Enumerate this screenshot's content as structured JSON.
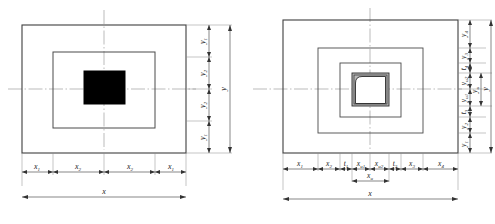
{
  "figure": {
    "panels": [
      {
        "id": "left",
        "name": "solid-core-section",
        "description": "Nested rectangles with solid black core",
        "rect_count": 2,
        "core": {
          "name": "solid-core",
          "fill": "#000000"
        },
        "horizontal_dimensions": {
          "segments": [
            "x1",
            "x2",
            "x2",
            "x1"
          ],
          "segment_labels": [
            "x",
            "x",
            "x",
            "x"
          ],
          "segment_subs": [
            "1",
            "2",
            "2",
            "1"
          ],
          "overall": "x",
          "overall_sub": ""
        },
        "vertical_dimensions": {
          "segments": [
            "y1",
            "y2",
            "y2",
            "y1"
          ],
          "segment_labels": [
            "y",
            "y",
            "y",
            "y"
          ],
          "segment_subs": [
            "1",
            "2",
            "2",
            "1"
          ],
          "overall": "y",
          "overall_sub": ""
        }
      },
      {
        "id": "right",
        "name": "hollow-tube-section",
        "description": "Three nested rectangles with hollow rounded tube core",
        "rect_count": 3,
        "core": {
          "name": "hollow-tube-core",
          "fill": "#b8b8b8"
        },
        "horizontal_dimensions": {
          "segment_labels": [
            "x",
            "x",
            "t",
            "x",
            "x",
            "t",
            "x",
            "x"
          ],
          "segment_subs": [
            "1",
            "2",
            "1",
            "u1",
            "u2",
            "2",
            "3",
            "4"
          ],
          "inner_group": "x",
          "inner_group_sub": "u",
          "overall": "x",
          "overall_sub": ""
        },
        "vertical_dimensions": {
          "segment_labels": [
            "y",
            "y",
            "t",
            "y",
            "y",
            "t",
            "y",
            "y"
          ],
          "segment_subs": [
            "4",
            "3",
            "4",
            "u2",
            "u1",
            "3",
            "2",
            "1"
          ],
          "inner_group": "y",
          "inner_group_sub": "u",
          "overall": "y",
          "overall_sub": ""
        }
      }
    ],
    "colors": {
      "outline": "#444444",
      "thin_line": "#666666",
      "centerline": "#888888",
      "core_fill_left": "#000000",
      "core_fill_right": "#b8b8b8",
      "background": "#ffffff"
    }
  }
}
